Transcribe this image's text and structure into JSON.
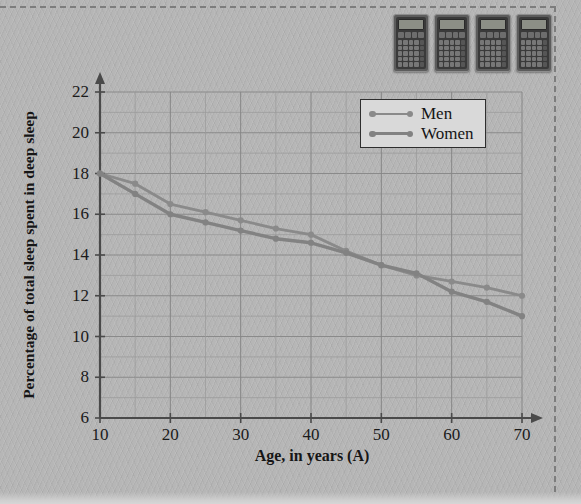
{
  "chart_data": {
    "type": "line",
    "title": "",
    "xlabel": "Age, in years (A)",
    "ylabel": "Percentage of total sleep spent in deep sleep",
    "xlim": [
      10,
      70
    ],
    "ylim": [
      6,
      22
    ],
    "xticks": [
      10,
      20,
      30,
      40,
      50,
      60,
      70
    ],
    "yticks": [
      6,
      8,
      10,
      12,
      14,
      16,
      18,
      20,
      22
    ],
    "x_minor_step": 5,
    "y_minor_step": 1,
    "grid": true,
    "legend_position": "top-right",
    "x": [
      10,
      15,
      20,
      25,
      30,
      35,
      40,
      45,
      50,
      55,
      60,
      65,
      70
    ],
    "series": [
      {
        "name": "Men",
        "color": "#8a8a8a",
        "values": [
          18.0,
          17.5,
          16.5,
          16.1,
          15.7,
          15.3,
          15.0,
          14.2,
          13.5,
          13.0,
          12.7,
          12.4,
          12.0
        ]
      },
      {
        "name": "Women",
        "color": "#828282",
        "values": [
          18.0,
          17.0,
          16.0,
          15.6,
          15.2,
          14.8,
          14.6,
          14.1,
          13.5,
          13.1,
          12.2,
          11.7,
          11.0
        ]
      }
    ]
  },
  "legend": {
    "entries": [
      {
        "label": "Men"
      },
      {
        "label": "Women"
      }
    ]
  },
  "axes": {
    "y_title": "Percentage of total sleep spent in deep sleep",
    "x_title": "Age, in years (A)",
    "y_tick_labels": [
      "22",
      "20",
      "18",
      "16",
      "14",
      "12",
      "10",
      "8",
      "6"
    ],
    "x_tick_labels": [
      "10",
      "20",
      "30",
      "40",
      "50",
      "60",
      "70"
    ]
  },
  "decorations": {
    "calculator_count": 4,
    "calculator_icon": "calculator-icon"
  },
  "colors": {
    "page_background": "#b6b6b6",
    "grid_line": "#8d8d8d",
    "axis_line": "#4a4a4a",
    "series_men": "#8a8a8a",
    "series_women": "#828282",
    "text": "#161616",
    "crop_mark": "#7d7d7d"
  }
}
